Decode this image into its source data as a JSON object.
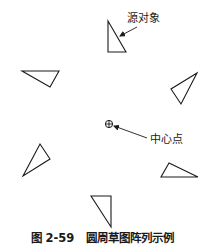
{
  "labels": {
    "source_object": "源对象",
    "center_point": "中心点"
  },
  "caption": {
    "number": "图 2-59",
    "title": "圆周草图阵列示例"
  },
  "colors": {
    "stroke": "#1a1a1a",
    "background": "#ffffff"
  },
  "triangles": [
    {
      "name": "source",
      "points": "108,21 108,52 126,52"
    },
    {
      "name": "left",
      "points": "22,71 59,71 50,87"
    },
    {
      "name": "right",
      "points": "197,73 171,89 181,104"
    },
    {
      "name": "lower-left",
      "points": "40,144 50,159 23,176"
    },
    {
      "name": "lower-right",
      "points": "169,163 161,177 198,177"
    },
    {
      "name": "bottom",
      "points": "91,196 111,196 111,227"
    }
  ]
}
